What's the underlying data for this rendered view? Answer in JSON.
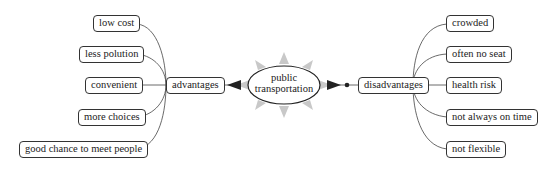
{
  "center": {
    "line1": "public",
    "line2": "transportation"
  },
  "advantages": {
    "label": "advantages",
    "items": [
      "low cost",
      "less polution",
      "convenient",
      "more choices",
      "good chance to meet people"
    ]
  },
  "disadvantages": {
    "label": "disadvantages",
    "items": [
      "crowded",
      "often no seat",
      "health risk",
      "not always on time",
      "not flexible"
    ]
  }
}
